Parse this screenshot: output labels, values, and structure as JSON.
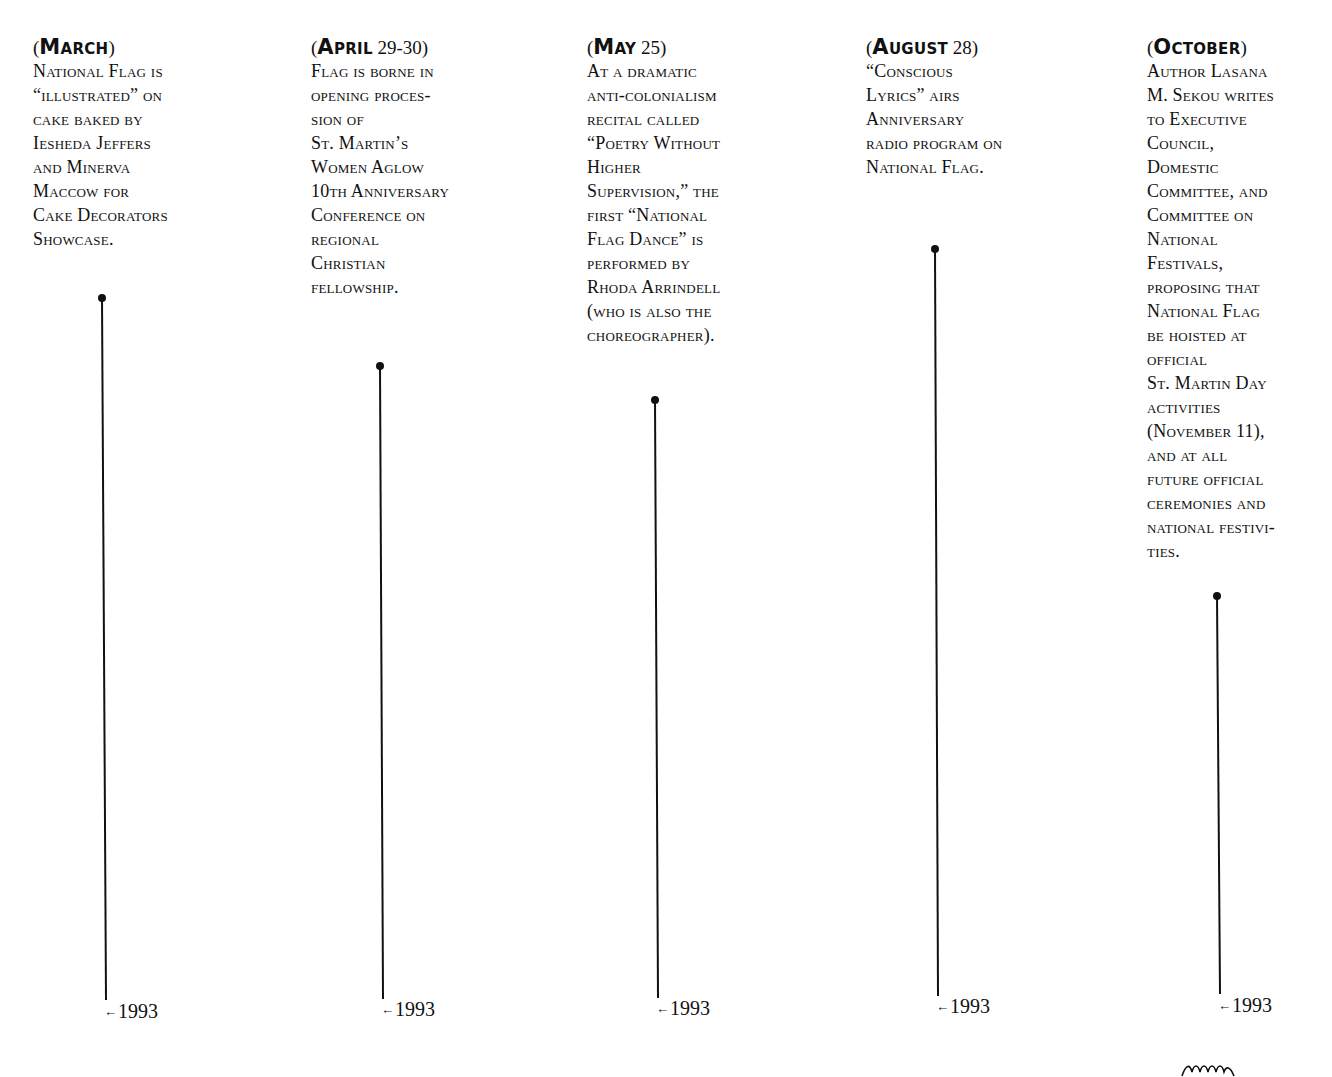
{
  "timeline": {
    "entries": [
      {
        "month": "March",
        "date_suffix": "",
        "lines": [
          "National Flag is",
          "“illustrated” on",
          "cake baked by",
          "Iesheda Jeffers",
          "and Minerva",
          "Maccow for",
          "Cake Decorators",
          "Showcase."
        ],
        "year": "1993"
      },
      {
        "month": "April",
        "date_suffix": " 29-30",
        "lines": [
          "Flag is borne in",
          "opening proces-",
          "sion of",
          "St. Martin’s",
          "Women Aglow",
          "10th Anniversary",
          "Conference on",
          "regional",
          "Christian",
          "fellowship."
        ],
        "year": "1993"
      },
      {
        "month": "May",
        "date_suffix": " 25",
        "lines": [
          "At a dramatic",
          "anti-colonialism",
          "recital called",
          "“Poetry Without",
          "Higher",
          "Supervision,” the",
          "first “National",
          "Flag Dance” is",
          "performed by",
          "Rhoda Arrindell",
          "(who is also the",
          "choreographer)."
        ],
        "year": "1993"
      },
      {
        "month": "August",
        "date_suffix": " 28",
        "lines": [
          "“Conscious",
          "Lyrics” airs",
          "Anniversary",
          "radio program on",
          "National Flag."
        ],
        "year": "1993"
      },
      {
        "month": "October",
        "date_suffix": "",
        "lines": [
          "Author Lasana",
          "M. Sekou writes",
          "to Executive",
          "Council,",
          "Domestic",
          "Committee, and",
          "Committee on",
          "National",
          "Festivals,",
          "proposing that",
          "National Flag",
          "be hoisted at",
          "official",
          "St. Martin Day",
          "activities",
          "(November 11),",
          "and at all",
          "future official",
          "ceremonies and",
          "national festivi-",
          "ties."
        ],
        "year": "1993"
      }
    ],
    "arrow_glyph": "←",
    "open_paren": "(",
    "close_paren": ")"
  }
}
